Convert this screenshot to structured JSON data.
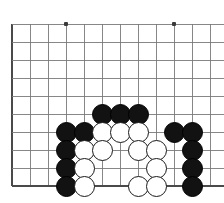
{
  "diagram": {
    "board": {
      "style": "go-goban",
      "line_color": "#7a7a7a",
      "border_color": "#4a4a4a",
      "background_color": "#ffffff",
      "origin_x": 12,
      "origin_y": 24,
      "cell_size": 18,
      "cols": 12,
      "rows": 10,
      "edges": {
        "left": true,
        "bottom": true,
        "top": false,
        "right": false
      },
      "star_points": [
        {
          "col": 3,
          "row": 0
        },
        {
          "col": 9,
          "row": 0
        }
      ]
    },
    "stone_colors": {
      "black": "#121212",
      "white": "#ffffff",
      "white_outline": "#1a1a1a"
    },
    "stone_radius": 10.5,
    "stones": [
      {
        "col": 5,
        "row": 5,
        "color": "black"
      },
      {
        "col": 6,
        "row": 5,
        "color": "black"
      },
      {
        "col": 7,
        "row": 5,
        "color": "black"
      },
      {
        "col": 3,
        "row": 6,
        "color": "black"
      },
      {
        "col": 4,
        "row": 6,
        "color": "black"
      },
      {
        "col": 5,
        "row": 6,
        "color": "white"
      },
      {
        "col": 6,
        "row": 6,
        "color": "white"
      },
      {
        "col": 7,
        "row": 6,
        "color": "white"
      },
      {
        "col": 9,
        "row": 6,
        "color": "black"
      },
      {
        "col": 10,
        "row": 6,
        "color": "black"
      },
      {
        "col": 3,
        "row": 7,
        "color": "black"
      },
      {
        "col": 4,
        "row": 7,
        "color": "white"
      },
      {
        "col": 5,
        "row": 7,
        "color": "white"
      },
      {
        "col": 7,
        "row": 7,
        "color": "white"
      },
      {
        "col": 8,
        "row": 7,
        "color": "white"
      },
      {
        "col": 10,
        "row": 7,
        "color": "black"
      },
      {
        "col": 3,
        "row": 8,
        "color": "black"
      },
      {
        "col": 4,
        "row": 8,
        "color": "white"
      },
      {
        "col": 8,
        "row": 8,
        "color": "white"
      },
      {
        "col": 10,
        "row": 8,
        "color": "black"
      },
      {
        "col": 3,
        "row": 9,
        "color": "black"
      },
      {
        "col": 4,
        "row": 9,
        "color": "white"
      },
      {
        "col": 7,
        "row": 9,
        "color": "white"
      },
      {
        "col": 8,
        "row": 9,
        "color": "white"
      },
      {
        "col": 10,
        "row": 9,
        "color": "black"
      }
    ]
  }
}
